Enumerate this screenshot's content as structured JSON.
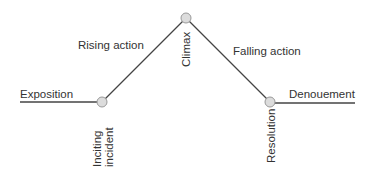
{
  "diagram": {
    "stages": {
      "exposition": "Exposition",
      "rising_action": "Rising action",
      "climax": "Climax",
      "falling_action": "Falling action",
      "denouement": "Denouement"
    },
    "points": {
      "inciting_line1": "Inciting",
      "inciting_line2": "incident",
      "climax": "Climax",
      "resolution": "Resolution"
    },
    "colors": {
      "line": "#444444",
      "node_fill": "#dcdcdc",
      "node_stroke": "#999999",
      "text": "#333333"
    }
  }
}
